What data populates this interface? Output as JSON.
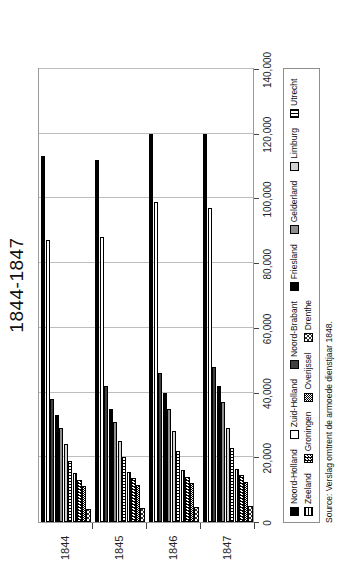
{
  "chart_data": {
    "type": "bar",
    "orientation": "horizontal",
    "title": "1844-1847",
    "xlabel": "",
    "ylabel": "",
    "categories": [
      "1844",
      "1845",
      "1846",
      "1847"
    ],
    "xlim": [
      0,
      140000
    ],
    "xticks": [
      0,
      20000,
      40000,
      60000,
      80000,
      100000,
      120000,
      140000
    ],
    "xticklabels": [
      "0",
      "20,000",
      "40,000",
      "60,000",
      "80,000",
      "100,000",
      "120,000",
      "140,000"
    ],
    "grid": "vertical",
    "legend_position": "bottom",
    "series": [
      {
        "name": "Noord-Holland",
        "pattern": "solid-black",
        "values": [
          113000,
          112000,
          120000,
          120000
        ]
      },
      {
        "name": "Zuid-Holland",
        "pattern": "white",
        "values": [
          87000,
          88000,
          99000,
          97000
        ]
      },
      {
        "name": "Noord-Brabant",
        "pattern": "darkgray",
        "values": [
          38000,
          42000,
          46000,
          48000
        ]
      },
      {
        "name": "Friesland",
        "pattern": "solid-black",
        "values": [
          33000,
          35000,
          40000,
          42000
        ]
      },
      {
        "name": "Gelderland",
        "pattern": "medgray",
        "values": [
          29000,
          31000,
          35000,
          37000
        ]
      },
      {
        "name": "Limburg",
        "pattern": "lightgray",
        "values": [
          24000,
          25000,
          28000,
          29000
        ]
      },
      {
        "name": "Utrecht",
        "pattern": "vstripe",
        "values": [
          19000,
          20000,
          22000,
          23000
        ]
      },
      {
        "name": "Zeeland",
        "pattern": "hstripe",
        "values": [
          15000,
          15500,
          16000,
          16500
        ]
      },
      {
        "name": "Groningen",
        "pattern": "checker",
        "values": [
          13000,
          13500,
          14000,
          14500
        ]
      },
      {
        "name": "Overijssel",
        "pattern": "checker2",
        "values": [
          11000,
          11500,
          12000,
          12500
        ]
      },
      {
        "name": "Drenthe",
        "pattern": "checker3",
        "values": [
          4000,
          4200,
          4500,
          5000
        ]
      }
    ]
  },
  "legend": {
    "rows": [
      [
        {
          "label": "Noord-Holland",
          "pattern": "solid-black"
        },
        {
          "label": "Zuid-Holland",
          "pattern": "white"
        },
        {
          "label": "Noord-Brabant",
          "pattern": "darkgray"
        },
        {
          "label": "Friesland",
          "pattern": "solid-black"
        },
        {
          "label": "Gelderland",
          "pattern": "medgray"
        },
        {
          "label": "Limburg",
          "pattern": "lightgray"
        },
        {
          "label": "Utrecht",
          "pattern": "vstripe"
        }
      ],
      [
        {
          "label": "Zeeland",
          "pattern": "hstripe"
        },
        {
          "label": "Groningen",
          "pattern": "checker"
        },
        {
          "label": "Overijssel",
          "pattern": "checker2"
        },
        {
          "label": "Drenthe",
          "pattern": "checker3"
        }
      ]
    ]
  },
  "source": {
    "text": "Source: Verslag omtrent de armoede dienstjaar 1848."
  }
}
